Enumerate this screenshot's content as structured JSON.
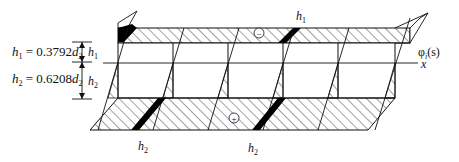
{
  "figure": {
    "annotations": {
      "h1_formula": {
        "var": "h",
        "sub": "1",
        "eq": " = 0.3792",
        "d": "d",
        "dsub": "2"
      },
      "h2_formula": {
        "var": "h",
        "sub": "2",
        "eq": " = 0.6208",
        "d": "d",
        "dsub": "2"
      },
      "h1_dim": {
        "var": "h",
        "sub": "1"
      },
      "h2_dim": {
        "var": "h",
        "sub": "2"
      },
      "top_label": {
        "var": "h",
        "sub": "1"
      },
      "bottom_label_left": {
        "var": "h",
        "sub": "2"
      },
      "bottom_label_right": {
        "var": "h",
        "sub": "2"
      },
      "phi_label": {
        "phi": "φ",
        "sub": "i",
        "arg": "(s)"
      },
      "axis_label": "x",
      "minus_sign": "−",
      "plus_sign": "+"
    },
    "colors": {
      "stroke": "#111111",
      "fill_solid": "#000000",
      "background": "#ffffff"
    },
    "columns_x": [
      118,
      173,
      228,
      283,
      338,
      395
    ]
  }
}
